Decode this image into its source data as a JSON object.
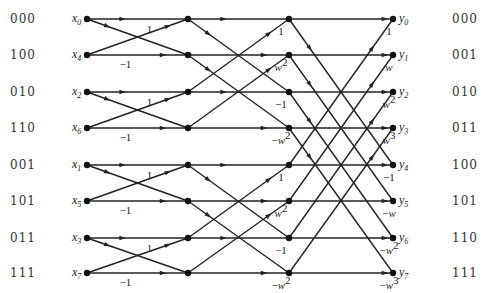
{
  "layout": {
    "columns_x": [
      87,
      188,
      289,
      393
    ],
    "rows_y": [
      19,
      55,
      92,
      128,
      165,
      201,
      238,
      273
    ]
  },
  "left_bits": [
    "000",
    "100",
    "010",
    "110",
    "001",
    "101",
    "011",
    "111"
  ],
  "right_bits": [
    "000",
    "001",
    "010",
    "011",
    "100",
    "101",
    "110",
    "111"
  ],
  "inputs": [
    {
      "var": "x",
      "sub": "0"
    },
    {
      "var": "x",
      "sub": "4"
    },
    {
      "var": "x",
      "sub": "2"
    },
    {
      "var": "x",
      "sub": "6"
    },
    {
      "var": "x",
      "sub": "1"
    },
    {
      "var": "x",
      "sub": "5"
    },
    {
      "var": "x",
      "sub": "3"
    },
    {
      "var": "x",
      "sub": "7"
    }
  ],
  "outputs": [
    {
      "var": "y",
      "sub": "0"
    },
    {
      "var": "y",
      "sub": "1"
    },
    {
      "var": "y",
      "sub": "2"
    },
    {
      "var": "y",
      "sub": "3"
    },
    {
      "var": "y",
      "sub": "4"
    },
    {
      "var": "y",
      "sub": "5"
    },
    {
      "var": "y",
      "sub": "6"
    },
    {
      "var": "y",
      "sub": "7"
    }
  ],
  "stages": [
    {
      "span": 1,
      "weights": [
        {
          "row": 0,
          "sign": "",
          "base": "1",
          "exp": ""
        },
        {
          "row": 1,
          "sign": "−",
          "base": "1",
          "exp": ""
        },
        {
          "row": 2,
          "sign": "",
          "base": "1",
          "exp": ""
        },
        {
          "row": 3,
          "sign": "−",
          "base": "1",
          "exp": ""
        },
        {
          "row": 4,
          "sign": "",
          "base": "1",
          "exp": ""
        },
        {
          "row": 5,
          "sign": "−",
          "base": "1",
          "exp": ""
        },
        {
          "row": 6,
          "sign": "",
          "base": "1",
          "exp": ""
        },
        {
          "row": 7,
          "sign": "−",
          "base": "1",
          "exp": ""
        }
      ]
    },
    {
      "span": 2,
      "weights": [
        {
          "row": 0,
          "sign": "",
          "base": "1",
          "exp": ""
        },
        {
          "row": 1,
          "sign": "",
          "base": "w",
          "exp": "2"
        },
        {
          "row": 2,
          "sign": "−",
          "base": "1",
          "exp": ""
        },
        {
          "row": 3,
          "sign": "−",
          "base": "w",
          "exp": "2"
        },
        {
          "row": 4,
          "sign": "",
          "base": "1",
          "exp": ""
        },
        {
          "row": 5,
          "sign": "",
          "base": "w",
          "exp": "2"
        },
        {
          "row": 6,
          "sign": "−",
          "base": "1",
          "exp": ""
        },
        {
          "row": 7,
          "sign": "−",
          "base": "w",
          "exp": "2"
        }
      ]
    },
    {
      "span": 4,
      "weights": [
        {
          "row": 0,
          "sign": "",
          "base": "1",
          "exp": ""
        },
        {
          "row": 1,
          "sign": "",
          "base": "w",
          "exp": ""
        },
        {
          "row": 2,
          "sign": "",
          "base": "w",
          "exp": "2"
        },
        {
          "row": 3,
          "sign": "",
          "base": "w",
          "exp": "3"
        },
        {
          "row": 4,
          "sign": "−",
          "base": "1",
          "exp": ""
        },
        {
          "row": 5,
          "sign": "−",
          "base": "w",
          "exp": ""
        },
        {
          "row": 6,
          "sign": "−",
          "base": "w",
          "exp": "2"
        },
        {
          "row": 7,
          "sign": "−",
          "base": "w",
          "exp": "3"
        }
      ]
    }
  ]
}
